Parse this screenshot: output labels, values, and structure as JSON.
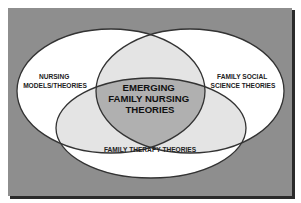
{
  "diagram": {
    "type": "venn",
    "colors": {
      "background": "#8e8e8e",
      "frame_shadow": "#2a2a2a",
      "circle_fill": "#ffffff",
      "pair_overlap_fill": "#e4e4e4",
      "center_overlap_fill": "#b0b0b0",
      "outline": "#333333"
    },
    "sets": [
      {
        "id": "nursing",
        "label_lines": [
          "NURSING",
          "MODELS/THEORIES"
        ]
      },
      {
        "id": "family_social",
        "label_lines": [
          "FAMILY SOCIAL",
          "SCIENCE THEORIES"
        ]
      },
      {
        "id": "family_therapy",
        "label_lines": [
          "FAMILY THERAPY THEORIES"
        ]
      }
    ],
    "intersection": {
      "label_lines": [
        "EMERGING",
        "FAMILY NURSING",
        "THEORIES"
      ]
    }
  }
}
